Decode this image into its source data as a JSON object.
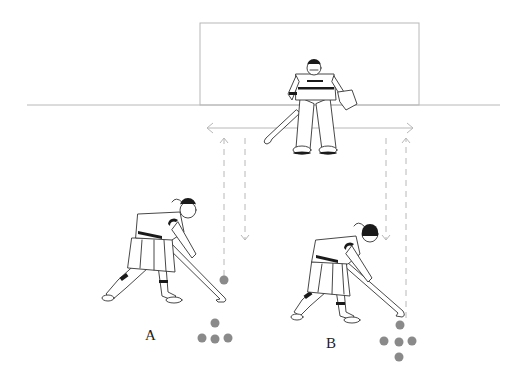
{
  "diagram": {
    "type": "field-hockey-drill",
    "labels": {
      "player_a": "A",
      "player_b": "B"
    },
    "colors": {
      "ball": "#8a8a8a",
      "line": "#b8b8b8",
      "ink": "#333333",
      "background": "#ffffff"
    },
    "elements": {
      "goal": {
        "x": 200,
        "y": 23,
        "width": 219,
        "height": 82
      },
      "baseline": {
        "x1": 27,
        "x2": 500,
        "y": 105
      },
      "lateral_arrow": {
        "x1": 207,
        "x2": 413,
        "y": 128
      },
      "dashed_arrows": [
        {
          "x": 224,
          "y1": 280,
          "y2": 138,
          "direction": "up"
        },
        {
          "x": 245,
          "y1": 138,
          "y2": 240,
          "direction": "down"
        },
        {
          "x": 386,
          "y1": 138,
          "y2": 240,
          "direction": "down"
        },
        {
          "x": 406,
          "y1": 318,
          "y2": 138,
          "direction": "up"
        }
      ],
      "balls_a": [
        [
          224,
          280
        ],
        [
          215,
          323
        ],
        [
          202,
          338
        ],
        [
          215,
          339
        ],
        [
          228,
          338
        ]
      ],
      "balls_b": [
        [
          400,
          325
        ],
        [
          384,
          341
        ],
        [
          399,
          342
        ],
        [
          412,
          341
        ],
        [
          399,
          357
        ]
      ]
    }
  }
}
